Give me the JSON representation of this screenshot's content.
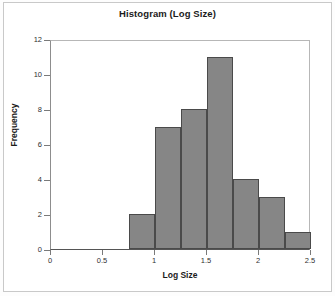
{
  "chart_data": {
    "type": "bar",
    "title": "Histogram (Log Size)",
    "xlabel": "Log Size",
    "ylabel": "Frequency",
    "xlim": [
      0,
      2.5
    ],
    "ylim": [
      0,
      12
    ],
    "grid": false,
    "legend": null,
    "bin_width": 0.25,
    "bin_edges": [
      0.75,
      1.0,
      1.25,
      1.5,
      1.75,
      2.0,
      2.25,
      2.5
    ],
    "categories": [
      "0.75-1.0",
      "1.0-1.25",
      "1.25-1.5",
      "1.5-1.75",
      "1.75-2.0",
      "2.0-2.25",
      "2.25-2.5"
    ],
    "values": [
      2,
      7,
      8,
      11,
      4,
      3,
      1
    ],
    "bars": [
      {
        "label": "0.75-1.0",
        "start": 0.75,
        "end": 1.0,
        "value": 2
      },
      {
        "label": "1.0-1.25",
        "start": 1.0,
        "end": 1.25,
        "value": 7
      },
      {
        "label": "1.25-1.5",
        "start": 1.25,
        "end": 1.5,
        "value": 8
      },
      {
        "label": "1.5-1.75",
        "start": 1.5,
        "end": 1.75,
        "value": 11
      },
      {
        "label": "1.75-2.0",
        "start": 1.75,
        "end": 2.0,
        "value": 4
      },
      {
        "label": "2.0-2.25",
        "start": 2.0,
        "end": 2.25,
        "value": 3
      },
      {
        "label": "2.25-2.5",
        "start": 2.25,
        "end": 2.5,
        "value": 1
      }
    ],
    "yticks": [
      0,
      2,
      4,
      6,
      8,
      10,
      12
    ],
    "ytick_labels": [
      "0",
      "2",
      "4",
      "6",
      "8",
      "10",
      "12"
    ],
    "xticks": [
      0,
      0.5,
      1,
      1.5,
      2,
      2.5
    ],
    "xtick_labels": [
      "0",
      "0.5",
      "1",
      "1.5",
      "2",
      "2.5"
    ],
    "colors": {
      "bar_fill": "#868686",
      "bar_stroke": "#4a4a4a",
      "axis": "#555555",
      "plot_background": "#ffffff",
      "page_background": "#ffffff",
      "frame_border": "#c9c9c9",
      "text": "#1b1b1b"
    }
  }
}
